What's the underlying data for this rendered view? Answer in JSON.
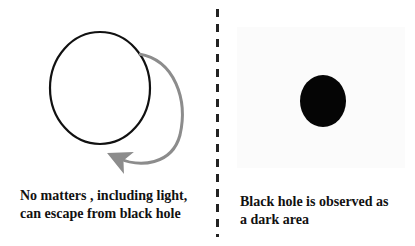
{
  "left_panel": {
    "caption_line1": "No matters , including light,",
    "caption_line2": "can escape from black hole",
    "circle": {
      "cx": 100,
      "cy": 88,
      "rx": 50,
      "ry": 56,
      "stroke": "#111111"
    },
    "arrow": {
      "color": "#8c8c8c"
    }
  },
  "right_panel": {
    "caption_line1": "Black hole is observed as",
    "caption_line2": "a dark area",
    "dark_area": {
      "cx": 101,
      "cy": 101,
      "rx": 23,
      "ry": 26,
      "fill": "#050505"
    }
  },
  "divider": {
    "style": "dashed",
    "color": "#222222"
  }
}
